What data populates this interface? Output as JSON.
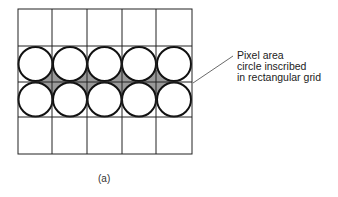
{
  "figure": {
    "caption": "(a)",
    "annotation": {
      "lines": [
        "Pixel area",
        "circle inscribed",
        "in rectangular grid"
      ]
    },
    "grid": {
      "columns": 5,
      "rows": 4,
      "circle_rows": [
        1,
        2
      ],
      "shaded_gap_color": "#9a9a9a",
      "line_color": "#222222"
    }
  }
}
